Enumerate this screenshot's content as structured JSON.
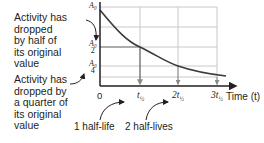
{
  "annotations": {
    "half_note": "Activity has dropped by half of its original value",
    "half_note_lines": [
      "Activity has",
      "dropped",
      "by half of",
      "its original",
      "value"
    ],
    "quarter_note_lines": [
      "Activity has",
      "dropped by",
      "a quarter of",
      "its original",
      "value"
    ],
    "one_half_life": "1 half-life",
    "two_half_lives": "2 half-lives"
  },
  "axes": {
    "y_labels": {
      "a0": "A₀",
      "a0_half_num": "A₀",
      "a0_half_den": "2",
      "a0_quarter_num": "A₀",
      "a0_quarter_den": "4"
    },
    "x_ticks": {
      "zero": "0",
      "t1": "t",
      "t1_sub": "½",
      "t2": "2t",
      "t2_sub": "½",
      "t3": "3t",
      "t3_sub": "½"
    },
    "x_label": "Time (t)"
  },
  "colors": {
    "axis": "#231f20",
    "grid": "#c8c8c8",
    "curve": "#3a3a3a",
    "arrow": "#231f20",
    "drop_arrow": "#8a8a8a"
  }
}
